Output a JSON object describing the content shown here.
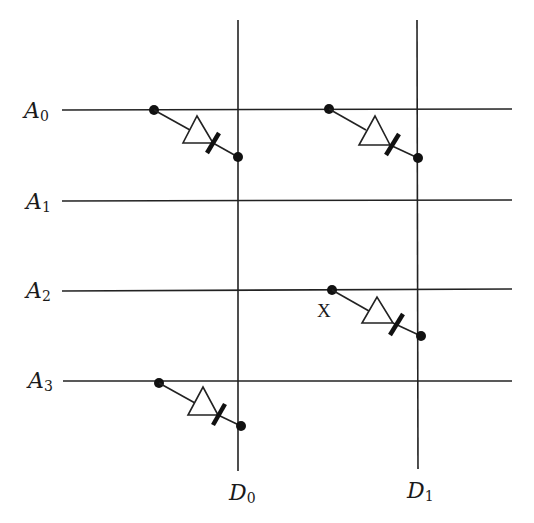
{
  "diagram": {
    "type": "diode ROM matrix",
    "address_lines": [
      {
        "id": "A0",
        "letter": "A",
        "sub": "0",
        "y": 110
      },
      {
        "id": "A1",
        "letter": "A",
        "sub": "1",
        "y": 201
      },
      {
        "id": "A2",
        "letter": "A",
        "sub": "2",
        "y": 291
      },
      {
        "id": "A3",
        "letter": "A",
        "sub": "3",
        "y": 381
      }
    ],
    "data_lines": [
      {
        "id": "D0",
        "letter": "D",
        "sub": "0",
        "x": 238
      },
      {
        "id": "D1",
        "letter": "D",
        "sub": "1",
        "x": 417
      }
    ],
    "diodes": [
      {
        "from": "A0",
        "to": "D0"
      },
      {
        "from": "A0",
        "to": "D1"
      },
      {
        "from": "A2",
        "to": "D1"
      },
      {
        "from": "A3",
        "to": "D0"
      }
    ],
    "marker": {
      "text": "X",
      "near": "A2-D1 diode anode"
    },
    "colors": {
      "line": "#222222",
      "background": "#ffffff"
    }
  }
}
